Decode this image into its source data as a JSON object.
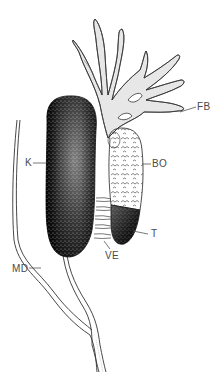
{
  "figure": {
    "type": "anatomical-illustration",
    "labels": [
      {
        "id": "FB",
        "text": "FB",
        "x": 197,
        "y": 103,
        "leader": [
          [
            180,
            112
          ],
          [
            196,
            107
          ]
        ]
      },
      {
        "id": "K",
        "text": "K",
        "x": 25,
        "y": 159,
        "leader": [
          [
            33,
            163
          ],
          [
            46,
            163
          ]
        ]
      },
      {
        "id": "BO",
        "text": "BO",
        "x": 152,
        "y": 159,
        "leader": [
          [
            141,
            164
          ],
          [
            151,
            164
          ]
        ]
      },
      {
        "id": "T",
        "text": "T",
        "x": 151,
        "y": 229,
        "leader": [
          [
            133,
            231
          ],
          [
            148,
            234
          ]
        ]
      },
      {
        "id": "VE",
        "text": "VE",
        "x": 105,
        "y": 251,
        "leader": [
          [
            106,
            240
          ],
          [
            111,
            249
          ]
        ]
      },
      {
        "id": "MD",
        "text": "MD",
        "x": 12,
        "y": 266,
        "leader": [
          [
            29,
            269
          ],
          [
            41,
            268
          ]
        ]
      }
    ],
    "colors": {
      "ink": "#1a1a1a",
      "label": "#4a4a4a",
      "background": "#ffffff"
    }
  }
}
